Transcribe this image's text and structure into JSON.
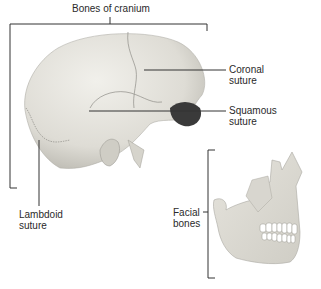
{
  "diagram": {
    "title": "Bones of cranium",
    "labels": {
      "coronal": [
        "Coronal",
        "suture"
      ],
      "squamous": [
        "Squamous",
        "suture"
      ],
      "lambdoid": [
        "Lambdoid",
        "suture"
      ],
      "facial": [
        "Facial",
        "bones"
      ]
    },
    "colors": {
      "bone": "#e8e6df",
      "bone_shadow": "#c9c7bf",
      "suture": "#8e8c86",
      "leader": "#333333",
      "text": "#2a2a2a"
    }
  }
}
